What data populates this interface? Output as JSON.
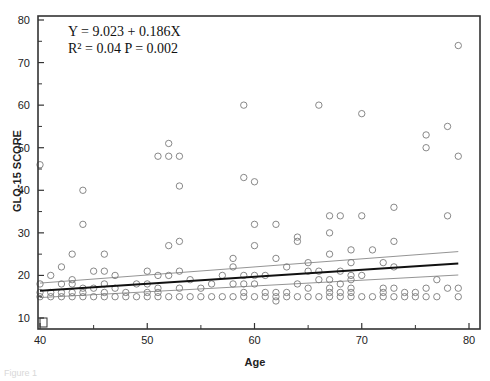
{
  "chart_data": {
    "type": "scatter",
    "title": "",
    "xlabel": "Age",
    "ylabel": "GLQ-15 SCORE",
    "xlim": [
      40,
      80
    ],
    "ylim": [
      10,
      80
    ],
    "xticks": [
      40,
      50,
      60,
      70,
      80
    ],
    "yticks": [
      10,
      20,
      30,
      40,
      50,
      60,
      70,
      80
    ],
    "grid": false,
    "legend": "none",
    "annotations": [
      "Y = 9.023 + 0.186X",
      "R² = 0.04  P = 0.002"
    ],
    "regression": {
      "intercept": 9.023,
      "slope": 0.186,
      "r2": 0.04,
      "p": 0.002,
      "ci_band": true
    },
    "regression_display": {
      "x": [
        40,
        79
      ],
      "y": [
        16.4,
        22.8
      ],
      "ci_upper": [
        18.2,
        25.6
      ],
      "ci_lower": [
        14.8,
        20.1
      ]
    },
    "points": [
      [
        40,
        46
      ],
      [
        40,
        18
      ],
      [
        40,
        16
      ],
      [
        40,
        15
      ],
      [
        41,
        20
      ],
      [
        41,
        16
      ],
      [
        41,
        15
      ],
      [
        42,
        22
      ],
      [
        42,
        18
      ],
      [
        42,
        16
      ],
      [
        42,
        15
      ],
      [
        43,
        25
      ],
      [
        43,
        19
      ],
      [
        43,
        18
      ],
      [
        43,
        16
      ],
      [
        43,
        15
      ],
      [
        44,
        40
      ],
      [
        44,
        32
      ],
      [
        44,
        17
      ],
      [
        44,
        16
      ],
      [
        44,
        15
      ],
      [
        45,
        21
      ],
      [
        45,
        17
      ],
      [
        45,
        15
      ],
      [
        46,
        25
      ],
      [
        46,
        21
      ],
      [
        46,
        18
      ],
      [
        46,
        16
      ],
      [
        46,
        15
      ],
      [
        47,
        20
      ],
      [
        47,
        17
      ],
      [
        47,
        15
      ],
      [
        48,
        16
      ],
      [
        48,
        15
      ],
      [
        49,
        18
      ],
      [
        49,
        15
      ],
      [
        50,
        21
      ],
      [
        50,
        18
      ],
      [
        50,
        16
      ],
      [
        50,
        15
      ],
      [
        51,
        48
      ],
      [
        51,
        20
      ],
      [
        51,
        17
      ],
      [
        51,
        16
      ],
      [
        51,
        15
      ],
      [
        52,
        51
      ],
      [
        52,
        48
      ],
      [
        52,
        27
      ],
      [
        52,
        20
      ],
      [
        52,
        15
      ],
      [
        53,
        48
      ],
      [
        53,
        41
      ],
      [
        53,
        28
      ],
      [
        53,
        21
      ],
      [
        53,
        17
      ],
      [
        53,
        15
      ],
      [
        54,
        19
      ],
      [
        54,
        15
      ],
      [
        55,
        17
      ],
      [
        55,
        15
      ],
      [
        56,
        18
      ],
      [
        56,
        15
      ],
      [
        57,
        20
      ],
      [
        57,
        15
      ],
      [
        58,
        24
      ],
      [
        58,
        22
      ],
      [
        58,
        18
      ],
      [
        58,
        15
      ],
      [
        59,
        60
      ],
      [
        59,
        43
      ],
      [
        59,
        20
      ],
      [
        59,
        18
      ],
      [
        59,
        16
      ],
      [
        59,
        15
      ],
      [
        60,
        42
      ],
      [
        60,
        32
      ],
      [
        60,
        27
      ],
      [
        60,
        20
      ],
      [
        60,
        18
      ],
      [
        60,
        15
      ],
      [
        61,
        20
      ],
      [
        61,
        16
      ],
      [
        61,
        15
      ],
      [
        62,
        32
      ],
      [
        62,
        24
      ],
      [
        62,
        16
      ],
      [
        62,
        15
      ],
      [
        62,
        14
      ],
      [
        63,
        22
      ],
      [
        63,
        16
      ],
      [
        63,
        15
      ],
      [
        64,
        29
      ],
      [
        64,
        28
      ],
      [
        64,
        18
      ],
      [
        64,
        15
      ],
      [
        65,
        23
      ],
      [
        65,
        21
      ],
      [
        65,
        17
      ],
      [
        65,
        15
      ],
      [
        66,
        60
      ],
      [
        66,
        21
      ],
      [
        66,
        19
      ],
      [
        66,
        15
      ],
      [
        67,
        34
      ],
      [
        67,
        30
      ],
      [
        67,
        25
      ],
      [
        67,
        19
      ],
      [
        67,
        17
      ],
      [
        67,
        16
      ],
      [
        67,
        15
      ],
      [
        68,
        34
      ],
      [
        68,
        21
      ],
      [
        68,
        18
      ],
      [
        68,
        16
      ],
      [
        68,
        15
      ],
      [
        69,
        26
      ],
      [
        69,
        23
      ],
      [
        69,
        20
      ],
      [
        69,
        19
      ],
      [
        69,
        17
      ],
      [
        69,
        16
      ],
      [
        69,
        15
      ],
      [
        70,
        58
      ],
      [
        70,
        34
      ],
      [
        70,
        20
      ],
      [
        70,
        15
      ],
      [
        71,
        26
      ],
      [
        71,
        15
      ],
      [
        72,
        23
      ],
      [
        72,
        17
      ],
      [
        72,
        16
      ],
      [
        72,
        15
      ],
      [
        73,
        36
      ],
      [
        73,
        28
      ],
      [
        73,
        22
      ],
      [
        73,
        17
      ],
      [
        73,
        15
      ],
      [
        74,
        16
      ],
      [
        74,
        15
      ],
      [
        75,
        16
      ],
      [
        75,
        15
      ],
      [
        76,
        53
      ],
      [
        76,
        50
      ],
      [
        76,
        17
      ],
      [
        76,
        15
      ],
      [
        77,
        19
      ],
      [
        77,
        15
      ],
      [
        78,
        55
      ],
      [
        78,
        34
      ],
      [
        78,
        17
      ],
      [
        79,
        74
      ],
      [
        79,
        48
      ],
      [
        79,
        17
      ],
      [
        79,
        15
      ]
    ]
  },
  "figure": {
    "caption_fragment": "Figure 1"
  }
}
